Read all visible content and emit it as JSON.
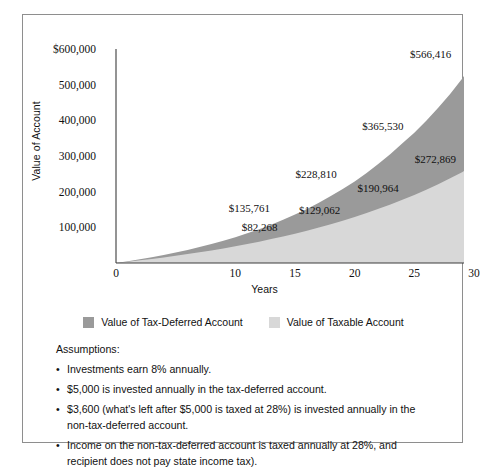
{
  "chart_data": {
    "type": "area",
    "title": "",
    "xlabel": "Years",
    "ylabel": "Value of Account",
    "xlim": [
      0,
      30
    ],
    "ylim": [
      0,
      600000
    ],
    "grid": false,
    "legend_position": "bottom",
    "x_ticks": [
      "0",
      "10",
      "15",
      "20",
      "25",
      "30"
    ],
    "x_tick_values": [
      0,
      10,
      15,
      20,
      25,
      30
    ],
    "y_ticks": [
      "$600,000",
      "500,000",
      "400,000",
      "300,000",
      "200,000",
      "100,000"
    ],
    "y_tick_values": [
      600000,
      500000,
      400000,
      300000,
      200000,
      100000
    ],
    "x": [
      0,
      1,
      2,
      3,
      4,
      5,
      6,
      7,
      8,
      9,
      10,
      11,
      12,
      13,
      14,
      15,
      16,
      17,
      18,
      19,
      20,
      21,
      22,
      23,
      24,
      25,
      26,
      27,
      28,
      29,
      30
    ],
    "series": [
      {
        "name": "Value of Tax-Deferred Account",
        "color": "#9a9a9a",
        "values": [
          0,
          5000,
          10400,
          16232,
          22531,
          29333,
          36680,
          44614,
          53185,
          62443,
          72446,
          83256,
          94936,
          107562,
          121207,
          135761,
          151707,
          168943,
          187578,
          207729,
          228810,
          252514,
          278116,
          305765,
          335626,
          365530,
          399000,
          435120,
          474129,
          516259,
          566416
        ]
      },
      {
        "name": "Value of Taxable Account",
        "color": "#d8d8d8",
        "values": [
          0,
          3600,
          7407,
          11434,
          15692,
          20196,
          24959,
          29997,
          35325,
          40960,
          46920,
          53223,
          59890,
          66941,
          74399,
          82268,
          90620,
          99453,
          108795,
          118675,
          129062,
          140100,
          151774,
          164121,
          177179,
          190964,
          205600,
          221078,
          237449,
          254765,
          272869
        ]
      }
    ],
    "annotations": [
      {
        "label": "$82,268",
        "x": 14.0,
        "y": 82268,
        "series": "Value of Taxable Account"
      },
      {
        "label": "$135,761",
        "x": 13.4,
        "y": 135761,
        "series": "Value of Tax-Deferred Account"
      },
      {
        "label": "$129,062",
        "x": 19.3,
        "y": 129062,
        "series": "Value of Taxable Account"
      },
      {
        "label": "$228,810",
        "x": 19.0,
        "y": 228810,
        "series": "Value of Tax-Deferred Account"
      },
      {
        "label": "$190,964",
        "x": 24.2,
        "y": 190964,
        "series": "Value of Taxable Account"
      },
      {
        "label": "$365,530",
        "x": 24.6,
        "y": 365530,
        "series": "Value of Tax-Deferred Account"
      },
      {
        "label": "$272,869",
        "x": 29.0,
        "y": 272869,
        "series": "Value of Taxable Account"
      },
      {
        "label": "$566,416",
        "x": 28.6,
        "y": 566416,
        "series": "Value of Tax-Deferred Account"
      }
    ]
  },
  "legend": {
    "entries": [
      {
        "label": "Value of Tax-Deferred Account",
        "color": "#9a9a9a"
      },
      {
        "label": "Value of Taxable Account",
        "color": "#d8d8d8"
      }
    ]
  },
  "assumptions": {
    "title": "Assumptions:",
    "items": [
      "Investments earn 8% annually.",
      "$5,000 is invested annually in the tax-deferred account.",
      "$3,600 (what's left after $5,000 is taxed at 28%) is invested annually in the non-tax-deferred account.",
      "Income on the non-tax-deferred account is taxed annually at 28%, and recipient does not pay state income tax)."
    ]
  },
  "colors": {
    "tax_deferred": "#9a9a9a",
    "taxable": "#d8d8d8",
    "axis": "#3c3c3c",
    "border": "#8e8e8e"
  }
}
